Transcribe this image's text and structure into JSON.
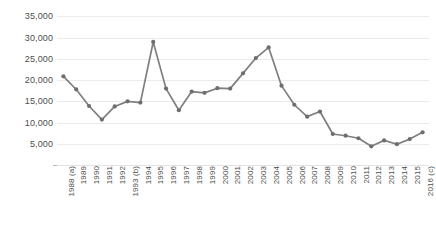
{
  "chart_data": {
    "type": "line",
    "title": "",
    "xlabel": "",
    "ylabel": "",
    "categories": [
      "1988 (a)",
      "1989",
      "1990",
      "1991",
      "1992",
      "1993 (b)",
      "1994",
      "1995",
      "1996",
      "1997",
      "1998",
      "1999",
      "2000",
      "2001",
      "2002",
      "2003",
      "2004",
      "2005",
      "2006",
      "2007",
      "2008",
      "2009",
      "2010",
      "2011",
      "2012",
      "2013",
      "2014",
      "2015",
      "2016 (c)"
    ],
    "values": [
      20900,
      17800,
      13900,
      10700,
      13800,
      15000,
      14700,
      29000,
      18000,
      12900,
      17300,
      17000,
      18100,
      18000,
      21600,
      25200,
      27700,
      18700,
      14200,
      11400,
      12600,
      7300,
      6900,
      6300,
      4400,
      5800,
      4900,
      6100,
      7700
    ],
    "series": [
      {
        "name": "series-1",
        "color": "#7f7f7f",
        "values": [
          20900,
          17800,
          13900,
          10700,
          13800,
          15000,
          14700,
          29000,
          18000,
          12900,
          17300,
          17000,
          18100,
          18000,
          21600,
          25200,
          27700,
          18700,
          14200,
          11400,
          12600,
          7300,
          6900,
          6300,
          4400,
          5800,
          4900,
          6100,
          7700
        ]
      }
    ],
    "ylim": [
      0,
      37000
    ],
    "yticks": [
      5000,
      10000,
      15000,
      20000,
      25000,
      30000,
      35000
    ],
    "ytick_labels": [
      "5,000",
      "10,000",
      "15,000",
      "20,000",
      "25,000",
      "30,000",
      "35,000"
    ],
    "grid": true,
    "legend": "none",
    "marker": "circle",
    "line_color": "#7f7f7f",
    "marker_color": "#6e6e6e",
    "gridline_color": "#eceaea",
    "tick_label_color": "#4d4d4d",
    "background": "#ffffff"
  }
}
